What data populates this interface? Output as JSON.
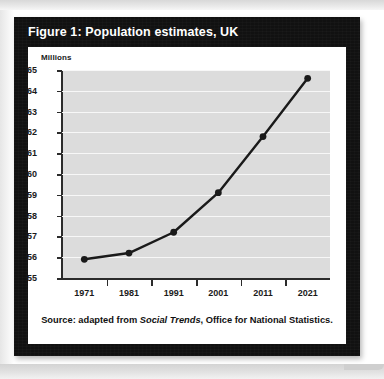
{
  "figure": {
    "title": "Figure 1: Population estimates, UK",
    "source_prefix": "Source: adapted from ",
    "source_italic": "Social Trends",
    "source_suffix": ", Office for National Statistics."
  },
  "colors": {
    "panel_background": "#111111",
    "card_background": "#ffffff",
    "plot_background": "#dcdcdc",
    "gridline": "#f7f7f7",
    "axis": "#2b2b2b",
    "series_line": "#1a1a1a",
    "marker": "#1a1a1a",
    "title_text": "#ffffff",
    "label_text": "#1a1a1a",
    "page_background": "#ffffff"
  },
  "chart_data": {
    "type": "line",
    "title": "Figure 1: Population estimates, UK",
    "xlabel": "",
    "ylabel": "Millions",
    "categories": [
      "1971",
      "1981",
      "1991",
      "2001",
      "2011",
      "2021"
    ],
    "x": [
      1971,
      1981,
      1991,
      2001,
      2011,
      2021
    ],
    "values": [
      55.9,
      56.2,
      57.2,
      59.1,
      61.8,
      64.6
    ],
    "series": [
      {
        "name": "UK population",
        "values": [
          55.9,
          56.2,
          57.2,
          59.1,
          61.8,
          64.6
        ]
      }
    ],
    "ylim": [
      55,
      65
    ],
    "yticks": [
      55,
      56,
      57,
      58,
      59,
      60,
      61,
      62,
      63,
      64,
      65
    ],
    "ytick_labels": [
      "55",
      "56",
      "57",
      "58",
      "59",
      "60",
      "61",
      "62",
      "63",
      "64",
      "65"
    ],
    "xtick_labels": [
      "1971",
      "1981",
      "1991",
      "2001",
      "2011",
      "2021"
    ],
    "grid": true,
    "grid_axis": "y",
    "legend": false,
    "markers": true,
    "marker_shape": "circle",
    "source": "Source: adapted from Social Trends, Office for National Statistics."
  }
}
